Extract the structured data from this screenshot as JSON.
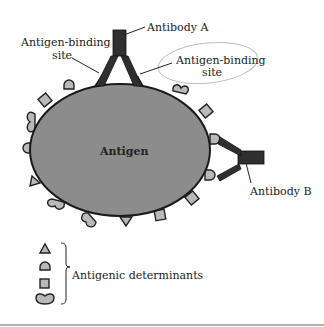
{
  "diagram": {
    "antigen_label": "Antigen",
    "antibody_a_label": "Antibody A",
    "antibody_b_label": "Antibody B",
    "binding_site_left": [
      "Antigen-binding",
      "site"
    ],
    "binding_site_right": [
      "Antigen-binding",
      "site"
    ],
    "legend": {
      "label": "Antigenic determinants",
      "shapes": [
        "triangle",
        "dome",
        "square",
        "heart"
      ]
    },
    "colors": {
      "antigen_fill": "#8c8c8c",
      "determinant_fill": "#b9b9b9",
      "antibody_fill": "#2f2f2f",
      "outline": "#222222",
      "highlight_ellipse": "#bdbdbd",
      "bottom_rule": "#9a9a9a"
    }
  }
}
